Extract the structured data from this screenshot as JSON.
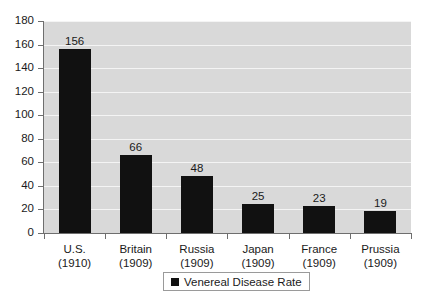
{
  "chart_data": {
    "type": "bar",
    "title": "",
    "subtitle": "",
    "xlabel": "",
    "ylabel": "",
    "categories": [
      "U.S.\n(1910)",
      "Britain\n(1909)",
      "Russia\n(1909)",
      "Japan\n(1909)",
      "France\n(1909)",
      "Prussia\n(1909)"
    ],
    "category_names": [
      "U.S.",
      "Britain",
      "Russia",
      "Japan",
      "France",
      "Prussia"
    ],
    "category_years": [
      "(1910)",
      "(1909)",
      "(1909)",
      "(1909)",
      "(1909)",
      "(1909)"
    ],
    "values": [
      156,
      66,
      48,
      25,
      23,
      19
    ],
    "value_labels": [
      "156",
      "66",
      "48",
      "25",
      "23",
      "19"
    ],
    "series": [
      {
        "name": "Venereal Disease Rate",
        "values": [
          156,
          66,
          48,
          25,
          23,
          19
        ],
        "color": "#111111"
      }
    ],
    "ylim": [
      0,
      180
    ],
    "ytick_values": [
      0,
      20,
      40,
      60,
      80,
      100,
      120,
      140,
      160,
      180
    ],
    "ytick_labels": [
      "0",
      "20",
      "40",
      "60",
      "80",
      "100",
      "120",
      "140",
      "160",
      "180"
    ],
    "grid": true,
    "grid_axis": "y",
    "grid_color": "#f4f4f4",
    "plot_background": "#d9d9d9",
    "page_background": "#ffffff",
    "axis_color": "#6e6e6e",
    "data_labels_shown": true,
    "legend": {
      "position": "bottom",
      "bordered": true,
      "entries": [
        {
          "label": "Venereal Disease Rate",
          "color": "#111111",
          "marker": "square"
        }
      ]
    }
  }
}
